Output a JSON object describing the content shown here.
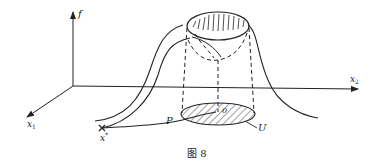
{
  "figure": {
    "caption": "图 8",
    "labels": {
      "f_axis": "f",
      "x1_axis": "x",
      "x1_sub": "1",
      "x2_axis": "x",
      "x2_sub": "2",
      "x_star": "x",
      "x_star_sup": "*",
      "path_P": "P",
      "origin": "0",
      "region_U": "U"
    },
    "colors": {
      "ink": "#222222",
      "background": "#ffffff"
    }
  }
}
